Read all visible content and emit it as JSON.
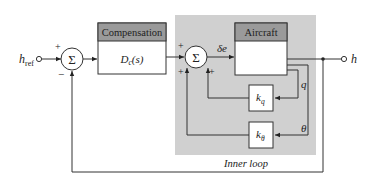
{
  "diagram": {
    "type": "block-diagram",
    "input": {
      "label": "h",
      "subscript": "ref"
    },
    "output": {
      "label": "h"
    },
    "outer_sum": {
      "symbol": "Σ",
      "signs": {
        "top": "+",
        "bottom": "−"
      }
    },
    "inner_sum": {
      "symbol": "Σ",
      "signs": {
        "left_top": "+",
        "left_bottom": "+",
        "right_bottom": "+"
      }
    },
    "compensation_block": {
      "header": "Compensation",
      "body": "D",
      "body_sub": "c",
      "body_suffix": "(s)"
    },
    "aircraft_block": {
      "header": "Aircraft",
      "body": ""
    },
    "control_signal": "δe",
    "gain_q": {
      "label": "k",
      "sub": "q"
    },
    "gain_theta": {
      "label": "k",
      "sub": "θ"
    },
    "signal_q": "q",
    "signal_theta": "θ",
    "inner_loop_label": "Inner loop",
    "colors": {
      "inner_loop_bg": "#cfcfcf",
      "block_header_bg": "#9a9a9a",
      "line": "#333333",
      "block_bg": "#ffffff"
    }
  }
}
